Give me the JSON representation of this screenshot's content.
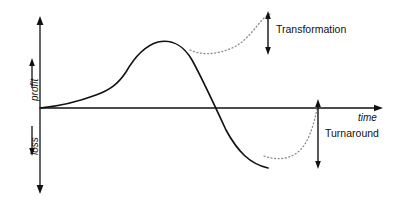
{
  "figure": {
    "title": "",
    "axes": {
      "y_axis": {
        "name": "vertical-axis",
        "upper_label": "profit",
        "lower_label": "loss",
        "arrow_both_ends": true,
        "x_px": 40,
        "top_px": 20,
        "bottom_px": 190
      },
      "x_axis": {
        "name": "horizontal-axis",
        "label": "time",
        "arrow_right": true,
        "y_px": 108,
        "left_px": 40,
        "right_px": 382
      }
    },
    "annotations": [
      {
        "name": "transformation",
        "label": "Transformation",
        "arrow": {
          "x_px": 268,
          "top_px": 14,
          "bottom_px": 52,
          "double_headed": true
        }
      },
      {
        "name": "turnaround",
        "label": "Turnaround",
        "arrow": {
          "x_px": 318,
          "top_px": 102,
          "bottom_px": 166,
          "double_headed": true
        }
      }
    ],
    "colors": {
      "ink": "#111111",
      "dotted": "#8a8a8a",
      "background": "#ffffff"
    }
  },
  "chart_data": {
    "type": "line",
    "title": "",
    "xlabel": "time",
    "ylabel": "loss profit",
    "grid": false,
    "legend": null,
    "xlim": [
      0,
      396
    ],
    "ylim": [
      200,
      0
    ],
    "axis_origin_px": [
      40,
      108
    ],
    "series": [
      {
        "name": "baseline-performance",
        "style": "solid",
        "color": "#111111",
        "path": "M 40,108 C 62,106 80,101 96,95 C 110,90 118,84 126,72 C 134,58 144,46 158,42 C 172,39 184,46 192,60 C 202,78 214,104 226,130 C 238,152 250,164 268,168"
      },
      {
        "name": "transformation-path",
        "style": "dotted",
        "color": "#8a8a8a",
        "path": "M 190,50 C 204,56 218,54 232,48 C 244,43 252,32 262,20 C 266,16 268,15 270,14"
      },
      {
        "name": "turnaround-path",
        "style": "dotted",
        "color": "#8a8a8a",
        "path": "M 264,156 C 276,160 288,160 298,152 C 308,144 314,126 318,104"
      }
    ],
    "description_points": {
      "curve_start": [
        40,
        108
      ],
      "curve_peak": [
        158,
        42
      ],
      "zero_crossing": [
        228,
        108
      ],
      "curve_end": [
        268,
        168
      ],
      "transformation_branch": [
        190,
        50
      ],
      "transformation_end": [
        270,
        14
      ],
      "turnaround_branch": [
        264,
        156
      ],
      "turnaround_end": [
        318,
        104
      ]
    }
  }
}
